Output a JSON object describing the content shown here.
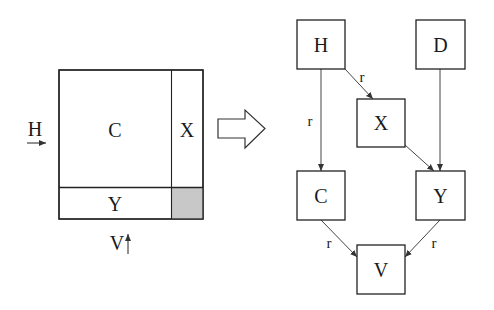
{
  "left_figure": {
    "regions": {
      "main": "C",
      "right_strip": "X",
      "bottom_strip": "Y"
    },
    "shaded_corner_color": "#c8c8c8",
    "horizontal_arrow_label": "H",
    "vertical_arrow_label": "V"
  },
  "transform_arrow": {
    "shape": "block-arrow-right"
  },
  "graph": {
    "nodes": [
      {
        "id": "H",
        "label": "H"
      },
      {
        "id": "D",
        "label": "D"
      },
      {
        "id": "X",
        "label": "X"
      },
      {
        "id": "C",
        "label": "C"
      },
      {
        "id": "Y",
        "label": "Y"
      },
      {
        "id": "V",
        "label": "V"
      }
    ],
    "edges": [
      {
        "from": "H",
        "to": "X",
        "label": "r"
      },
      {
        "from": "H",
        "to": "C",
        "label": "r"
      },
      {
        "from": "X",
        "to": "Y",
        "label": ""
      },
      {
        "from": "D",
        "to": "Y",
        "label": ""
      },
      {
        "from": "C",
        "to": "V",
        "label": "r"
      },
      {
        "from": "Y",
        "to": "V",
        "label": "r"
      }
    ]
  }
}
